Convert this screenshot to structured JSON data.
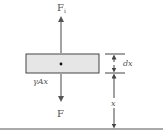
{
  "diagram": {
    "force_up_label": "F",
    "force_up_subscript": "i",
    "force_down_label": "F",
    "weight_label": "γAx",
    "thickness_label": "dx",
    "height_label": "x",
    "colors": {
      "line": "#555555",
      "element_fill": "#e6e6e6",
      "element_stroke": "#444444",
      "background": "#ffffff"
    }
  }
}
